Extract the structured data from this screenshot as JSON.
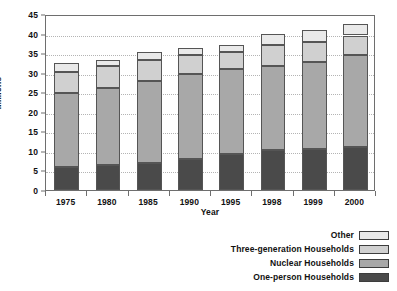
{
  "chart_data": {
    "type": "bar",
    "subtype": "stacked-bar",
    "title": "",
    "xlabel": "Year",
    "ylabel": "Millions",
    "ylim": [
      0,
      45
    ],
    "ytick_step": 5,
    "yticks": [
      "45",
      "40",
      "35",
      "30",
      "25",
      "20",
      "15",
      "10",
      "5",
      "0"
    ],
    "grid": true,
    "grid_axis": "y",
    "legend_position": "bottom-right",
    "categories": [
      "1975",
      "1980",
      "1985",
      "1990",
      "1995",
      "1998",
      "1999",
      "2000"
    ],
    "series": [
      {
        "name": "One-person Households",
        "color": "#4a4a4a",
        "values": [
          5.9,
          6.5,
          7.0,
          7.9,
          9.2,
          10.3,
          10.4,
          11.0
        ]
      },
      {
        "name": "Nuclear Households",
        "color": "#a8a8a8",
        "values": [
          18.9,
          19.7,
          20.9,
          21.8,
          21.7,
          21.5,
          22.3,
          23.5
        ]
      },
      {
        "name": "Three-generation Households",
        "color": "#d0d0d0",
        "values": [
          5.3,
          5.5,
          5.4,
          4.9,
          4.5,
          5.3,
          5.1,
          5.0
        ]
      },
      {
        "name": "Other",
        "color": "#e9e9e9",
        "values": [
          2.4,
          1.6,
          1.9,
          1.7,
          1.8,
          2.9,
          3.2,
          3.0
        ]
      }
    ],
    "totals": [
      32.5,
      33.3,
      35.2,
      36.3,
      37.2,
      40.0,
      41.0,
      42.5
    ],
    "axis_color": "#6e6e6e",
    "gridline_color": "#b4b4b4",
    "bar_border_color": "#555555"
  },
  "legend": {
    "items": [
      {
        "label": "Other",
        "color": "#e9e9e9"
      },
      {
        "label": "Three-generation Households",
        "color": "#d0d0d0"
      },
      {
        "label": "Nuclear Households",
        "color": "#a8a8a8"
      },
      {
        "label": "One-person Households",
        "color": "#4a4a4a"
      }
    ]
  }
}
